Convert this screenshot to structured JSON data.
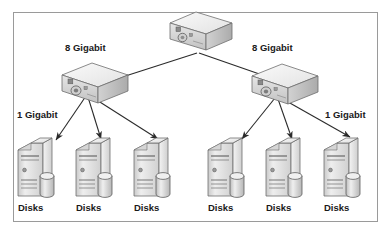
{
  "diagram": {
    "type": "network-topology",
    "background_color": "#ffffff",
    "border_color": "#9a9a9a",
    "line_color": "#2b2b2b",
    "device_fill_light": "#f2f2f2",
    "device_fill_mid": "#d8d8d8",
    "device_fill_dark": "#b4b4b4",
    "text_color": "#1a1a1a"
  },
  "labels": {
    "uplink_left": "8 Gigabit",
    "uplink_right": "8 Gigabit",
    "downlink_left": "1 Gigabit",
    "downlink_right": "1 Gigabit"
  },
  "switches": [
    {
      "id": "core",
      "name": "core-switch",
      "x": 196,
      "y": 30
    },
    {
      "id": "left",
      "name": "left-switch",
      "x": 96,
      "y": 84
    },
    {
      "id": "right",
      "name": "right-switch",
      "x": 286,
      "y": 84
    }
  ],
  "servers": [
    {
      "id": "s1",
      "label": "Disks",
      "x": 35,
      "y": 170
    },
    {
      "id": "s2",
      "label": "Disks",
      "x": 93,
      "y": 170
    },
    {
      "id": "s3",
      "label": "Disks",
      "x": 151,
      "y": 170
    },
    {
      "id": "s4",
      "label": "Disks",
      "x": 225,
      "y": 170
    },
    {
      "id": "s5",
      "label": "Disks",
      "x": 283,
      "y": 170
    },
    {
      "id": "s6",
      "label": "Disks",
      "x": 341,
      "y": 170
    }
  ],
  "links": [
    {
      "from": "core",
      "to": "left",
      "speed": "8 Gigabit"
    },
    {
      "from": "core",
      "to": "right",
      "speed": "8 Gigabit"
    },
    {
      "from": "left",
      "to": "s1",
      "speed": "1 Gigabit"
    },
    {
      "from": "left",
      "to": "s2",
      "speed": "1 Gigabit"
    },
    {
      "from": "left",
      "to": "s3",
      "speed": "1 Gigabit"
    },
    {
      "from": "right",
      "to": "s4",
      "speed": "1 Gigabit"
    },
    {
      "from": "right",
      "to": "s5",
      "speed": "1 Gigabit"
    },
    {
      "from": "right",
      "to": "s6",
      "speed": "1 Gigabit"
    }
  ]
}
